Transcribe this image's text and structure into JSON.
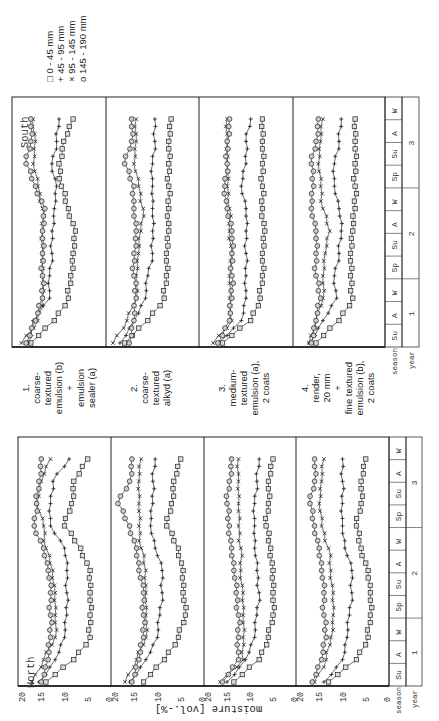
{
  "legend": {
    "items": [
      {
        "marker": "square",
        "symbol": "□",
        "label": "0 -  45 mm"
      },
      {
        "marker": "plus",
        "symbol": "+",
        "label": "45 -  95 mm"
      },
      {
        "marker": "cross",
        "symbol": "×",
        "label": "95 - 145 mm"
      },
      {
        "marker": "circle",
        "symbol": "o",
        "label": "145 - 190 mm"
      }
    ]
  },
  "captions": [
    {
      "number": "1.",
      "text": "coarse-\ntextured\nemulsion (b)\n+\nemulsion\nsealer (a)"
    },
    {
      "number": "2.",
      "text": "coarse-\ntextured\nalkyd (a)"
    },
    {
      "number": "3.",
      "text": "medium-\ntextured\nemulsion (a),\n2 coats"
    },
    {
      "number": "4.",
      "text": "render,\n20 mm\n+\nfine textured\nemulsion (b),\n2 coats"
    }
  ],
  "axis": {
    "ylabel": "moisture [vol.-%]",
    "ticks": [
      "20",
      "15",
      "10",
      "5",
      "0"
    ],
    "season_label": "season",
    "year_label": "year",
    "seasons": [
      "Su",
      "A",
      "W",
      "Sp",
      "Su",
      "A",
      "W",
      "Sp",
      "Su",
      "A",
      "W"
    ],
    "years": [
      "1",
      "2",
      "3"
    ]
  },
  "chart_data": [
    {
      "type": "line",
      "title": "South",
      "xlabel": "season / year",
      "ylabel": "moisture [vol.-%]",
      "ylim": [
        0,
        20
      ],
      "x": [
        "Su1",
        "A1",
        "W1",
        "Sp2",
        "Su2",
        "A2",
        "W2",
        "Sp3",
        "Su3",
        "A3",
        "W3"
      ],
      "panels": [
        {
          "name": "1. coarse-textured emulsion (b) + emulsion sealer (a)",
          "series": [
            {
              "name": "0-45 mm",
              "values": [
                16,
                11,
                8,
                7.5,
                7,
                6.5,
                8,
                9.5,
                10,
                9,
                7
              ]
            },
            {
              "name": "45-95 mm",
              "values": [
                16.5,
                15.5,
                12,
                12,
                11.5,
                11.5,
                11,
                10.5,
                11.5,
                10.5,
                10
              ]
            },
            {
              "name": "95-145 mm",
              "values": [
                18,
                14.5,
                13.5,
                13.5,
                13.5,
                13.5,
                13.5,
                14.5,
                15.5,
                15,
                15.5
              ]
            },
            {
              "name": "145-190 mm",
              "values": [
                17,
                15,
                13.5,
                13.5,
                13.5,
                13.5,
                13,
                15,
                17,
                16,
                16
              ]
            }
          ]
        },
        {
          "name": "2. coarse-textured alkyd (a)",
          "series": [
            {
              "name": "0-45 mm",
              "values": [
                16,
                11,
                7.5,
                7,
                7,
                6.5,
                6.5,
                6.5,
                6.5,
                6.5,
                6
              ]
            },
            {
              "name": "45-95 mm",
              "values": [
                17,
                14,
                11.5,
                11,
                10,
                10,
                10,
                10,
                10,
                9.5,
                9.5
              ]
            },
            {
              "name": "95-145 mm",
              "values": [
                18.5,
                15.5,
                13.5,
                13.5,
                13,
                12.5,
                12,
                13,
                14,
                13.5,
                13.5
              ]
            },
            {
              "name": "145-190 mm",
              "values": [
                15,
                14,
                13.5,
                14,
                14,
                13.5,
                14,
                14,
                16,
                14.5,
                14.5
              ]
            }
          ]
        },
        {
          "name": "3. medium-textured emulsion (a), 2 coats",
          "series": [
            {
              "name": "0-45 mm",
              "values": [
                15,
                9,
                7,
                6.5,
                6.5,
                6,
                6.5,
                6.5,
                6.5,
                6.5,
                6.5
              ]
            },
            {
              "name": "45-95 mm",
              "values": [
                16,
                11,
                10,
                10,
                10,
                10,
                10,
                11,
                10,
                10,
                9
              ]
            },
            {
              "name": "95-145 mm",
              "values": [
                17,
                13,
                13.5,
                13.5,
                13,
                13.5,
                13.5,
                14,
                14,
                14,
                14
              ]
            },
            {
              "name": "145-190 mm",
              "values": [
                16,
                13.5,
                13,
                13,
                13,
                13,
                14,
                14.5,
                14,
                14,
                13.5
              ]
            }
          ]
        },
        {
          "name": "4. render, 20 mm + fine textured emulsion (b), 2 coats",
          "series": [
            {
              "name": "0-45 mm",
              "values": [
                15,
                10,
                7,
                7.5,
                7.5,
                7,
                6.5,
                6.5,
                6.5,
                6.5,
                6.5
              ]
            },
            {
              "name": "45-95 mm",
              "values": [
                16.5,
                13.5,
                10.5,
                11,
                10,
                9.5,
                10,
                11,
                11,
                10,
                9.5
              ]
            },
            {
              "name": "95-145 mm",
              "values": [
                16.5,
                15,
                13.5,
                13.5,
                13,
                12,
                13.5,
                14,
                14.5,
                14,
                13.5
              ]
            },
            {
              "name": "145-190 mm",
              "values": [
                16,
                15,
                14,
                15,
                15,
                15,
                16,
                15.5,
                16,
                15,
                14.5
              ]
            }
          ]
        }
      ]
    },
    {
      "type": "line",
      "title": "North",
      "xlabel": "season / year",
      "ylabel": "moisture [vol.-%]",
      "ylim": [
        0,
        20
      ],
      "x": [
        "Su1",
        "A1",
        "W1",
        "Sp2",
        "Su2",
        "A2",
        "W2",
        "Sp3",
        "Su3",
        "A3",
        "W3"
      ],
      "panels": [
        {
          "name": "1. coarse-textured emulsion (b) + emulsion sealer (a)",
          "series": [
            {
              "name": "0-45 mm",
              "values": [
                14,
                8,
                4.5,
                4.5,
                4.5,
                4.5,
                6.5,
                10,
                8.5,
                8,
                5
              ]
            },
            {
              "name": "45-95 mm",
              "values": [
                15.5,
                12,
                10,
                9.5,
                9.5,
                9.5,
                10,
                13,
                13,
                12.5,
                9
              ]
            },
            {
              "name": "95-145 mm",
              "values": [
                17,
                14.5,
                12,
                12,
                12,
                12.5,
                14,
                14.5,
                16,
                15,
                13
              ]
            },
            {
              "name": "145-190 mm",
              "values": [
                15,
                13.5,
                13,
                13,
                13,
                13.5,
                14.5,
                16.5,
                16,
                15.5,
                15
              ]
            }
          ]
        },
        {
          "name": "2. coarse-textured alkyd (a)",
          "series": [
            {
              "name": "0-45 mm",
              "values": [
                13,
                8.5,
                5.5,
                4,
                4.5,
                4.5,
                5.5,
                8,
                7,
                6.5,
                5
              ]
            },
            {
              "name": "45-95 mm",
              "values": [
                16,
                12.5,
                10,
                9.5,
                9,
                9,
                10.5,
                11.5,
                11,
                11,
                10.5
              ]
            },
            {
              "name": "95-145 mm",
              "values": [
                17,
                14.5,
                12.5,
                12.5,
                12.5,
                12.5,
                13.5,
                14,
                14,
                14,
                13.5
              ]
            },
            {
              "name": "145-190 mm",
              "values": [
                15.5,
                14,
                13,
                13,
                13,
                14,
                14.5,
                16,
                18.5,
                16,
                15.5
              ]
            }
          ]
        },
        {
          "name": "3. medium-textured emulsion (a), 2 coats",
          "series": [
            {
              "name": "0-45 mm",
              "values": [
                13.5,
                8,
                6,
                5,
                5,
                5,
                5.5,
                6.5,
                6,
                6,
                5
              ]
            },
            {
              "name": "45-95 mm",
              "values": [
                15,
                11,
                9,
                8.5,
                8,
                8.5,
                9,
                9,
                9,
                8.5,
                8
              ]
            },
            {
              "name": "95-145 mm",
              "values": [
                16.5,
                11.5,
                11.5,
                11.5,
                11.5,
                12,
                12,
                12.5,
                12.5,
                12.5,
                12.5
              ]
            },
            {
              "name": "145-190 mm",
              "values": [
                16,
                12.5,
                12.5,
                12.5,
                13,
                13.5,
                14,
                14.5,
                15,
                14.5,
                14
              ]
            }
          ]
        },
        {
          "name": "4. render, 20 mm + fine textured emulsion (b), 2 coats",
          "series": [
            {
              "name": "0-45 mm",
              "values": [
                13,
                7,
                4.5,
                4,
                4,
                4.5,
                6,
                7,
                6,
                6,
                5
              ]
            },
            {
              "name": "45-95 mm",
              "values": [
                14,
                10,
                9,
                8.5,
                8,
                8,
                9.5,
                10,
                10,
                10,
                10
              ]
            },
            {
              "name": "95-145 mm",
              "values": [
                16,
                13.5,
                12.5,
                12,
                12,
                12.5,
                13,
                14.5,
                15,
                14.5,
                14
              ]
            },
            {
              "name": "145-190 mm",
              "values": [
                16.5,
                14.5,
                13.5,
                14,
                14,
                14.5,
                15,
                16,
                17,
                16,
                16
              ]
            }
          ]
        }
      ]
    }
  ]
}
